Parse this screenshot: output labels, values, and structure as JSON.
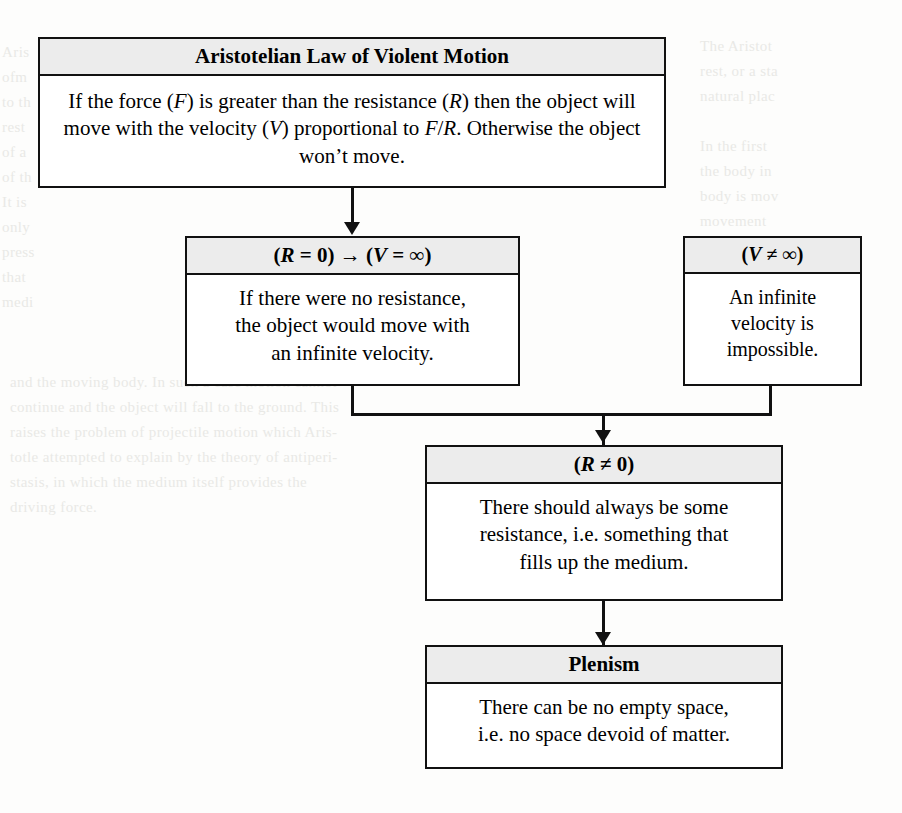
{
  "diagram": {
    "title": "Aristotelian Law of Violent Motion",
    "boxes": {
      "law": {
        "header": "Aristotelian Law of Violent Motion",
        "body_line1_a": "If the force (",
        "body_line1_F": "F",
        "body_line1_b": ") is greater than the resistance (",
        "body_line1_R": "R",
        "body_line1_c": ") then",
        "body_line2_a": "the object will move with the velocity (",
        "body_line2_V": "V",
        "body_line2_b": ") proportional",
        "body_line3_a": "to ",
        "body_line3_F": "F",
        "body_line3_slash": "/",
        "body_line3_R": "R",
        "body_line3_b": ". Otherwise the object won’t move.",
        "body_plain": "If the force (F) is greater than the resistance (R) then the object will move with the velocity (V) proportional to F/R. Otherwise the object won’t move."
      },
      "r_zero": {
        "header_open": "(",
        "header_R": "R",
        "header_eq": " = 0) → (",
        "header_V": "V",
        "header_inf": " = ∞)",
        "header_plain": "(R = 0) → (V = ∞)",
        "body_line1": "If there were no resistance,",
        "body_line2": "the object would move with",
        "body_line3": "an infinite velocity.",
        "body_plain": "If there were no resistance, the object would move with an infinite velocity."
      },
      "v_not_inf": {
        "header_open": "(",
        "header_V": "V",
        "header_rest": " ≠ ∞)",
        "header_plain": "(V ≠ ∞)",
        "body_line1": "An infinite",
        "body_line2": "velocity is",
        "body_line3": "impossible.",
        "body_plain": "An infinite velocity is impossible."
      },
      "r_not_zero": {
        "header_open": "(",
        "header_R": "R",
        "header_rest": " ≠ 0)",
        "header_plain": "(R ≠ 0)",
        "body_line1": "There should always be some",
        "body_line2": "resistance, i.e. something that",
        "body_line3": "fills up the medium.",
        "body_plain": "There should always be some resistance, i.e. something that fills up the medium."
      },
      "plenism": {
        "header": "Plenism",
        "body_line1": "There can be no empty space,",
        "body_line2": "i.e. no space devoid of matter.",
        "body_plain": "There can be no empty space, i.e. no space devoid of matter."
      }
    },
    "colors": {
      "header_fill": "#ececec",
      "border": "#111111",
      "body_fill": "#ffffff",
      "page_background": "#fdfdfc",
      "text": "#000000"
    },
    "bleed_text": {
      "left": "Aris\nofm\nto th\nrest\nof a\nof th\nIt is\nonly\npress\nthat\nmedi",
      "right": "The Aristot\nrest, or a sta\nnatural plac\n\nIn the first\nthe body in\nbody is mov\nmovement\nsuch a mot\ntransfers t\ntend to dis",
      "bottom": "and the moving body. In such a case motion cannot\ncontinue and the object will fall to the ground. This\nraises the problem of projectile motion which Aris-\ntotle attempted to explain by the theory of antiperi-\nstasis, in which the medium itself provides the\ndriving force."
    }
  }
}
